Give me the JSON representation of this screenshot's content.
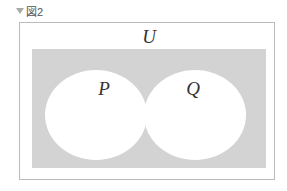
{
  "caption": {
    "icon": "triangle-down-icon",
    "label": "図2"
  },
  "diagram": {
    "type": "venn",
    "universe_label": "U",
    "sets": [
      {
        "label": "P"
      },
      {
        "label": "Q"
      }
    ],
    "shaded_region": "complement of P ∪ Q",
    "colors": {
      "shade": "#d3d3d3",
      "frame": "#aaaaaa",
      "sets_fill": "#ffffff"
    }
  }
}
